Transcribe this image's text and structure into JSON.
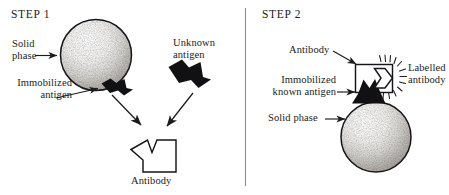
{
  "figure": {
    "background_color": "#ffffff",
    "ink_color": "#1b1b1b",
    "divider_color": "#8d8d8d"
  },
  "panels": [
    {
      "id": "step1",
      "title": "STEP 1",
      "labels": {
        "solid_phase_line1": "Solid",
        "solid_phase_line2": "phase",
        "immobilized_line1": "Immobilized",
        "immobilized_line2": "antigen",
        "unknown_line1": "Unknown",
        "unknown_line2": "antigen",
        "antibody": "Antibody"
      }
    },
    {
      "id": "step2",
      "title": "STEP 2",
      "labels": {
        "antibody": "Antibody",
        "immobilized_line1": "Immobilized",
        "immobilized_line2": "known antigen",
        "labelled_line1": "Labelled",
        "labelled_line2": "antibody",
        "solid_phase": "Solid  phase"
      }
    }
  ],
  "icons": {
    "sphere": "stippled-sphere",
    "antigen": "black-wedge-antigen",
    "antibody": "white-notched-antibody",
    "label_burst": "radiating-label-burst",
    "arrow": "arrowhead-pointer",
    "divider": "vertical-rule"
  }
}
